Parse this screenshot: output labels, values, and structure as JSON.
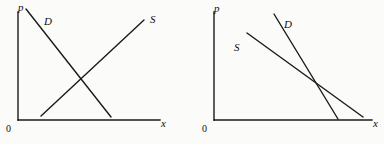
{
  "figure": {
    "background_color": "#fbfbfa",
    "ink_color": "#1a1a1a",
    "panels": [
      {
        "id": "left",
        "name": "normal-supply-demand",
        "axes": {
          "origin_label": "0",
          "y_axis_label": "p",
          "x_axis_label": "x"
        },
        "curves": [
          {
            "name": "demand-curve",
            "label": "D",
            "label_x": 44,
            "label_y": 22,
            "x1": 26,
            "y1": 9,
            "x2": 111,
            "y2": 117,
            "slope": "downward"
          },
          {
            "name": "supply-curve",
            "label": "S",
            "label_x": 152,
            "label_y": 22,
            "x1": 41,
            "y1": 116,
            "x2": 144,
            "y2": 20,
            "slope": "upward"
          }
        ],
        "equilibrium": {
          "x": 78,
          "y": 75
        }
      },
      {
        "id": "right",
        "name": "both-downward-sloping",
        "axes": {
          "origin_label": "0",
          "y_axis_label": "p",
          "x_axis_label": "x"
        },
        "curves": [
          {
            "name": "supply-curve",
            "label": "S",
            "label_x": 45,
            "label_y": 47,
            "x1": 55,
            "y1": 33,
            "x2": 171,
            "y2": 117,
            "slope": "downward"
          },
          {
            "name": "demand-curve",
            "label": "D",
            "label_x": 94,
            "label_y": 25,
            "x1": 82,
            "y1": 14,
            "x2": 146,
            "y2": 119,
            "slope": "downward-steep"
          }
        ],
        "equilibrium": {
          "x": 137,
          "y": 91
        }
      }
    ]
  }
}
